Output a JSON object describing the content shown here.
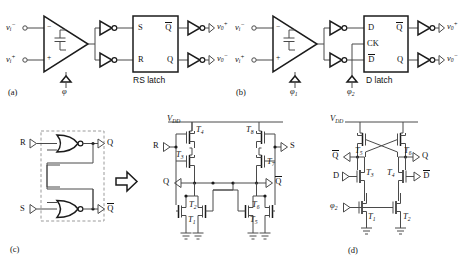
{
  "figure": {
    "stroke_color": "#3a3a3a",
    "bold_stroke_color": "#111111",
    "dashed_color": "#9a9a9a",
    "background": "#ffffff"
  },
  "panels": {
    "a": {
      "tag": "(a)",
      "inputs": [
        {
          "name": "v_i_minus",
          "base": "v",
          "sub": "i",
          "sup": "−"
        },
        {
          "name": "v_i_plus",
          "base": "v",
          "sub": "i",
          "sup": "+"
        }
      ],
      "outputs": [
        {
          "name": "v_o_plus",
          "base": "v",
          "sub": "0",
          "sup": "+"
        },
        {
          "name": "v_o_minus",
          "base": "v",
          "sub": "0",
          "sup": "−"
        }
      ],
      "amp_inputs": [
        "−",
        "+"
      ],
      "clock": {
        "base": "φ",
        "sub": ""
      },
      "block": {
        "caption": "RS latch",
        "left_pins": [
          "S",
          "R"
        ],
        "right_pins": [
          "Q̅",
          "Q"
        ]
      }
    },
    "b": {
      "tag": "(b)",
      "inputs": [
        {
          "name": "v_i_minus",
          "base": "v",
          "sub": "i",
          "sup": "−"
        },
        {
          "name": "v_i_plus",
          "base": "v",
          "sub": "i",
          "sup": "+"
        }
      ],
      "outputs": [
        {
          "name": "v_o_plus",
          "base": "v",
          "sub": "0",
          "sup": "+"
        },
        {
          "name": "v_o_minus",
          "base": "v",
          "sub": "0",
          "sup": "−"
        }
      ],
      "amp_inputs": [
        "−",
        "+"
      ],
      "clocks": [
        {
          "base": "φ",
          "sub": "1"
        },
        {
          "base": "φ",
          "sub": "2"
        }
      ],
      "block": {
        "caption": "D latch",
        "left_pins": [
          "D",
          "CK",
          "D̅"
        ],
        "right_pins": [
          "Q̅",
          "Q"
        ]
      }
    },
    "c": {
      "tag": "(c)",
      "gate_inputs": [
        "R",
        "S"
      ],
      "gate_outputs": [
        "Q",
        "Q̅"
      ],
      "gate_type": "NOR",
      "arrow": "⇒",
      "schematic": {
        "supply": {
          "base": "V",
          "sub": "DD"
        },
        "input_left": "R",
        "input_right": "S",
        "node_left": "Q",
        "node_right": "Q̅",
        "transistors": [
          "T1",
          "T2",
          "T3",
          "T4",
          "T5",
          "T6",
          "T7",
          "T8"
        ],
        "transistor_labels": [
          {
            "id": "T4",
            "base": "T",
            "sub": "4"
          },
          {
            "id": "T8",
            "base": "T",
            "sub": "8"
          },
          {
            "id": "T3",
            "base": "T",
            "sub": "3"
          },
          {
            "id": "T7",
            "base": "T",
            "sub": "7"
          },
          {
            "id": "T2",
            "base": "T",
            "sub": "2"
          },
          {
            "id": "T6",
            "base": "T",
            "sub": "6"
          },
          {
            "id": "T1",
            "base": "T",
            "sub": "1"
          },
          {
            "id": "T5",
            "base": "T",
            "sub": "5"
          }
        ]
      }
    },
    "d": {
      "tag": "(d)",
      "supply": {
        "base": "V",
        "sub": "DD"
      },
      "node_left": "Q̅",
      "node_right": "Q",
      "input_left": "D",
      "input_right": "D̅",
      "clock": {
        "base": "φ",
        "sub": "2"
      },
      "transistor_labels": [
        {
          "id": "T5",
          "base": "T",
          "sub": "5"
        },
        {
          "id": "T6",
          "base": "T",
          "sub": "6"
        },
        {
          "id": "T3",
          "base": "T",
          "sub": "3"
        },
        {
          "id": "T4",
          "base": "T",
          "sub": "4"
        },
        {
          "id": "T1",
          "base": "T",
          "sub": "1"
        },
        {
          "id": "T2",
          "base": "T",
          "sub": "2"
        }
      ]
    }
  }
}
